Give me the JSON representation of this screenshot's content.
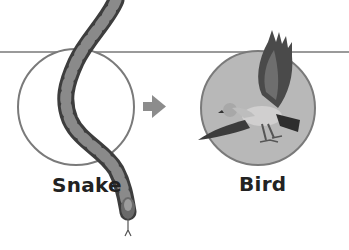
{
  "diagram": {
    "type": "food-chain",
    "nodes": [
      {
        "id": "snake",
        "label": "Snake",
        "circle_fill": "#ffffff",
        "circle_stroke": "#7a7a7a"
      },
      {
        "id": "bird",
        "label": "Bird",
        "circle_fill": "#b8b8b8",
        "circle_stroke": "#7a7a7a"
      }
    ],
    "edges": [
      {
        "from": "snake",
        "to": "bird",
        "arrow_color": "#8c8c8c"
      }
    ],
    "colors": {
      "line": "#9a9a9a",
      "text": "#222222"
    }
  }
}
